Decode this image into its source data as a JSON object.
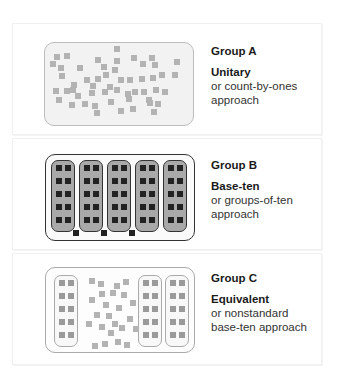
{
  "groups": [
    {
      "id": "A",
      "title": "Group A",
      "approach": "Unitary",
      "description_line1": "or count-by-ones",
      "description_line2": "approach"
    },
    {
      "id": "B",
      "title": "Group B",
      "approach": "Base-ten",
      "description_line1": "or groups-of-ten",
      "description_line2": "approach"
    },
    {
      "id": "C",
      "title": "Group C",
      "approach": "Equivalent",
      "description_line1": "or nonstandard",
      "description_line2": "base-ten approach"
    }
  ],
  "diagram": {
    "group_a": {
      "loose_units": 53,
      "ten_groups": 0
    },
    "group_b": {
      "ten_groups": 5,
      "loose_units": 3
    },
    "group_c": {
      "ten_groups": 3,
      "loose_units": 23
    },
    "colors": {
      "unit_light": "#b3b3b3",
      "unit_dark": "#222222",
      "ten_fill_b": "#a9a9a9",
      "box_a_fill": "#f2f2f2",
      "border_dark": "#333333"
    }
  }
}
